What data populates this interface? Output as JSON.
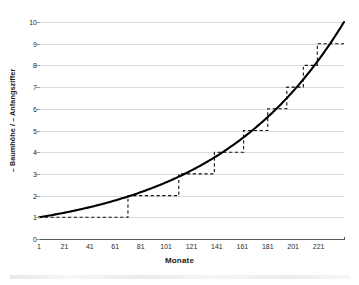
{
  "chart_data": {
    "type": "line",
    "title": "",
    "xlabel": "Monate",
    "ylabel": "– Baumhöhe / – Anfangsziffer",
    "xlim": [
      1,
      241
    ],
    "ylim": [
      0,
      10
    ],
    "grid": true,
    "legend": "none",
    "x_tick_labels": [
      "1",
      "21",
      "41",
      "61",
      "81",
      "101",
      "121",
      "141",
      "161",
      "181",
      "201",
      "221"
    ],
    "x_tick_values": [
      1,
      21,
      41,
      61,
      81,
      101,
      121,
      141,
      161,
      181,
      201,
      221
    ],
    "y_tick_labels": [
      "0",
      "1",
      "2",
      "3",
      "4",
      "5",
      "6",
      "7",
      "8",
      "9",
      "10"
    ],
    "y_tick_values": [
      0,
      1,
      2,
      3,
      4,
      5,
      6,
      7,
      8,
      9,
      10
    ],
    "series": [
      {
        "name": "Baumhöhe",
        "style": "solid",
        "color": "#000000",
        "kind": "smooth-exponential",
        "x": [
          1,
          13,
          25,
          37,
          49,
          61,
          73,
          85,
          97,
          109,
          121,
          133,
          145,
          157,
          169,
          181,
          193,
          205,
          217,
          229,
          241
        ],
        "values": [
          1.0,
          1.12,
          1.26,
          1.41,
          1.58,
          1.78,
          2.0,
          2.24,
          2.51,
          2.82,
          3.16,
          3.55,
          3.98,
          4.47,
          5.01,
          5.62,
          6.31,
          7.08,
          7.94,
          8.91,
          10.0
        ]
      },
      {
        "name": "Anfangsziffer",
        "style": "dashed",
        "color": "#000000",
        "kind": "step",
        "step_starts": [
          1,
          71,
          111,
          139,
          162,
          181,
          196,
          209,
          220,
          230
        ],
        "step_values": [
          1,
          2,
          3,
          4,
          5,
          6,
          7,
          8,
          9,
          9
        ],
        "step_end": 241
      }
    ]
  },
  "axes": {
    "y_title": "– Baumhöhe / – Anfangsziffer",
    "x_title": "Monate"
  }
}
